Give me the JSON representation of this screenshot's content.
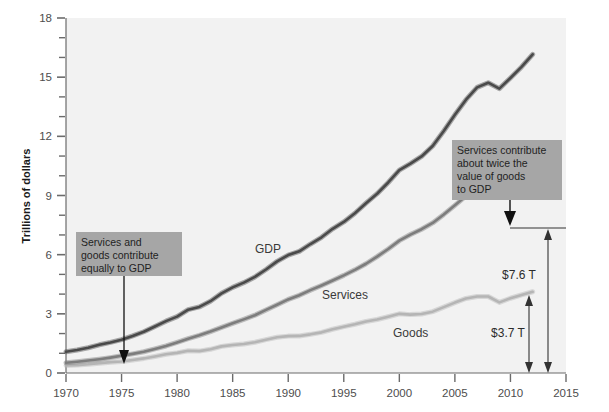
{
  "chart_data": {
    "type": "line",
    "title": "",
    "xlabel": "",
    "ylabel": "Trillions of dollars",
    "xlim": [
      1970,
      2015
    ],
    "ylim": [
      0,
      18
    ],
    "grid": false,
    "legend_position": "inline-labels",
    "x_ticks": [
      1970,
      1975,
      1980,
      1985,
      1990,
      1995,
      2000,
      2005,
      2010,
      2015
    ],
    "x_tick_labels": [
      "1970",
      "1975",
      "1980",
      "1985",
      "1990",
      "1995",
      "2000",
      "2005",
      "2010",
      "2015"
    ],
    "y_ticks": [
      0,
      3,
      6,
      9,
      12,
      15,
      18
    ],
    "y_tick_labels": [
      "0",
      "3",
      "6",
      "9",
      "12",
      "15",
      "18"
    ],
    "y_minor_tick_step": 1,
    "x": [
      1970,
      1971,
      1972,
      1973,
      1974,
      1975,
      1976,
      1977,
      1978,
      1979,
      1980,
      1981,
      1982,
      1983,
      1984,
      1985,
      1986,
      1987,
      1988,
      1989,
      1990,
      1991,
      1992,
      1993,
      1994,
      1995,
      1996,
      1997,
      1998,
      1999,
      2000,
      2001,
      2002,
      2003,
      2004,
      2005,
      2006,
      2007,
      2008,
      2009,
      2010,
      2011,
      2012
    ],
    "series": [
      {
        "name": "GDP",
        "color": "#4a4a4a",
        "values": [
          1.08,
          1.17,
          1.28,
          1.43,
          1.55,
          1.69,
          1.88,
          2.09,
          2.36,
          2.63,
          2.86,
          3.21,
          3.35,
          3.64,
          4.04,
          4.34,
          4.58,
          4.87,
          5.25,
          5.66,
          5.98,
          6.17,
          6.54,
          6.88,
          7.31,
          7.66,
          8.1,
          8.61,
          9.09,
          9.66,
          10.29,
          10.62,
          10.98,
          11.51,
          12.27,
          13.09,
          13.86,
          14.48,
          14.72,
          14.42,
          14.96,
          15.52,
          16.16
        ]
      },
      {
        "name": "Services",
        "color": "#7d7d7d",
        "values": [
          0.52,
          0.57,
          0.63,
          0.7,
          0.78,
          0.87,
          0.97,
          1.08,
          1.22,
          1.37,
          1.55,
          1.74,
          1.91,
          2.1,
          2.31,
          2.52,
          2.72,
          2.93,
          3.2,
          3.46,
          3.73,
          3.94,
          4.2,
          4.44,
          4.69,
          4.95,
          5.23,
          5.54,
          5.9,
          6.29,
          6.71,
          7.02,
          7.29,
          7.61,
          8.04,
          8.5,
          8.98,
          9.41,
          9.68,
          9.72,
          9.97,
          10.3,
          10.72
        ]
      },
      {
        "name": "Goods",
        "color": "#b5b5b5",
        "values": [
          0.38,
          0.4,
          0.44,
          0.5,
          0.55,
          0.58,
          0.66,
          0.74,
          0.84,
          0.95,
          1.02,
          1.13,
          1.11,
          1.2,
          1.35,
          1.42,
          1.47,
          1.56,
          1.69,
          1.81,
          1.87,
          1.88,
          1.96,
          2.06,
          2.22,
          2.35,
          2.47,
          2.61,
          2.71,
          2.85,
          3.0,
          2.96,
          2.99,
          3.11,
          3.34,
          3.57,
          3.78,
          3.88,
          3.88,
          3.58,
          3.79,
          3.96,
          4.12
        ]
      }
    ],
    "annotations": [
      {
        "id": "left-callout",
        "text_lines": [
          "Services and",
          "goods contribute",
          "equally to GDP"
        ],
        "box_fill": "#a6a6a6",
        "arrow_target_year": 1975,
        "arrow_target_value": 0.6
      },
      {
        "id": "right-callout",
        "text_lines": [
          "Services contribute",
          "about twice the",
          "value of goods",
          "to GDP"
        ],
        "box_fill": "#a6a6a6",
        "arrow_target_year": 2012,
        "arrow_target_value": 10.72
      }
    ],
    "measurements": [
      {
        "id": "services-bracket",
        "label": "$7.6 T",
        "from_value": 0,
        "to_value": 7.6
      },
      {
        "id": "goods-bracket",
        "label": "$3.7 T",
        "from_value": 0,
        "to_value": 3.7
      }
    ],
    "series_inline_labels": [
      {
        "name": "GDP",
        "label": "GDP"
      },
      {
        "name": "Services",
        "label": "Services"
      },
      {
        "name": "Goods",
        "label": "Goods"
      }
    ],
    "colors": {
      "page_background": "#ffffff",
      "plot_background": "#f2f2f2",
      "axis": "#6b6b6b",
      "tick_text": "#4d4d4d",
      "callout_box": "#a6a6a6",
      "annotation_arrow": "#111111"
    }
  }
}
